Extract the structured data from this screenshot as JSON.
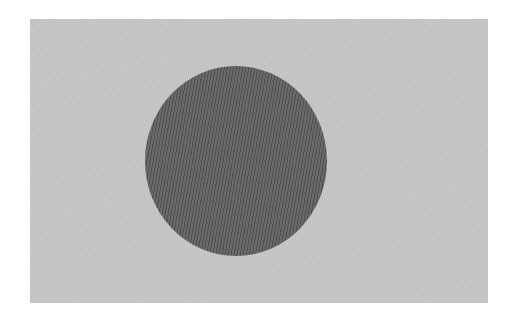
{
  "image": {
    "description": "grayscale flag: light rectangular field with a dark disc offset toward the hoist",
    "field": {
      "color": "#c6c6c6",
      "x": 30,
      "y": 19,
      "width": 458,
      "height": 284
    },
    "disc": {
      "color": "#5e5e5e",
      "center_x": 236,
      "center_y": 161,
      "width": 182,
      "height": 190
    },
    "background_color": "#ffffff"
  }
}
